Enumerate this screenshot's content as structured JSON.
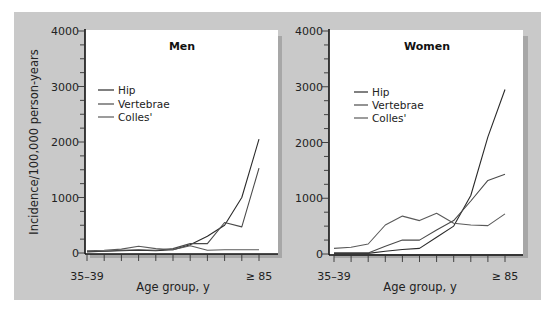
{
  "figure": {
    "ylabel": "Incidence/100,000 person-years",
    "xlabel": "Age group, y",
    "x_first_label": "35–39",
    "x_last_label": "≥ 85",
    "y_ticks": [
      "0",
      "1000",
      "2000",
      "3000",
      "4000"
    ],
    "legend": [
      "Hip",
      "Vertebrae",
      "Colles'"
    ],
    "colors": {
      "Hip": "#2a2a2a",
      "Vertebrae": "#4a4a4a",
      "Colles'": "#5a5a5a",
      "background": "#c9c9c9",
      "panel": "#ffffff"
    }
  },
  "chart_data": [
    {
      "type": "line",
      "title": "Men",
      "xlabel": "Age group, y",
      "ylabel": "Incidence/100,000 person-years",
      "categories": [
        "35–39",
        "40–44",
        "45–49",
        "50–54",
        "55–59",
        "60–64",
        "65–69",
        "70–74",
        "75–79",
        "80–84",
        "≥85"
      ],
      "ylim": [
        0,
        4000
      ],
      "yticks": [
        0,
        1000,
        2000,
        3000,
        4000
      ],
      "legend_position": "upper left",
      "grid": false,
      "series": [
        {
          "name": "Hip",
          "values": [
            20,
            30,
            40,
            50,
            40,
            60,
            150,
            300,
            500,
            1000,
            2050
          ]
        },
        {
          "name": "Vertebrae",
          "values": [
            30,
            30,
            50,
            60,
            50,
            80,
            170,
            170,
            550,
            470,
            1530
          ]
        },
        {
          "name": "Colles'",
          "values": [
            40,
            50,
            70,
            120,
            80,
            60,
            130,
            50,
            60,
            60,
            60
          ]
        }
      ]
    },
    {
      "type": "line",
      "title": "Women",
      "xlabel": "Age group, y",
      "ylabel": "Incidence/100,000 person-years",
      "categories": [
        "35–39",
        "40–44",
        "45–49",
        "50–54",
        "55–59",
        "60–64",
        "65–69",
        "70–74",
        "75–79",
        "80–84",
        "≥85"
      ],
      "ylim": [
        0,
        4000
      ],
      "yticks": [
        0,
        1000,
        2000,
        3000,
        4000
      ],
      "legend_position": "upper left",
      "grid": false,
      "series": [
        {
          "name": "Hip",
          "values": [
            10,
            10,
            10,
            50,
            80,
            100,
            300,
            500,
            1050,
            2100,
            2950
          ]
        },
        {
          "name": "Vertebrae",
          "values": [
            20,
            20,
            20,
            140,
            250,
            250,
            430,
            600,
            950,
            1320,
            1430
          ]
        },
        {
          "name": "Colles'",
          "values": [
            100,
            120,
            180,
            520,
            680,
            600,
            730,
            550,
            520,
            510,
            720
          ]
        }
      ]
    }
  ]
}
